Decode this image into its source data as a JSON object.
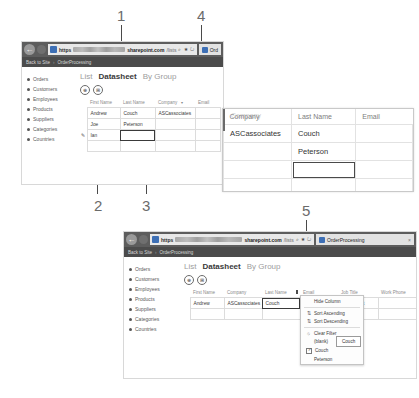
{
  "figure": {
    "callouts": [
      {
        "id": "1",
        "x": 117,
        "y": 8
      },
      {
        "id": "4",
        "x": 197,
        "y": 8
      },
      {
        "id": "2",
        "x": 94,
        "y": 198
      },
      {
        "id": "3",
        "x": 142,
        "y": 198
      },
      {
        "id": "5",
        "x": 302,
        "y": 203
      }
    ]
  },
  "top_window": {
    "browser": {
      "back_icon": "back-arrow-icon",
      "forward_icon": "forward-arrow-icon",
      "protocol_label": "https",
      "url_domain": "sharepoint.com",
      "url_tail": "/lists",
      "url_icons": "⌕ ★ ↻",
      "tab_label": "Ord"
    },
    "breadcrumb": {
      "back_link": "Back to Site",
      "separator": "›",
      "current": "OrderProcessing"
    },
    "sidebar": {
      "items": [
        {
          "label": "Orders"
        },
        {
          "label": "Customers"
        },
        {
          "label": "Employees"
        },
        {
          "label": "Products"
        },
        {
          "label": "Suppliers"
        },
        {
          "label": "Categories"
        },
        {
          "label": "Countries"
        }
      ]
    },
    "view_tabs": [
      {
        "label": "List",
        "active": false
      },
      {
        "label": "Datasheet",
        "active": true
      },
      {
        "label": "By Group",
        "active": false
      }
    ],
    "toolbar": {
      "new_item_icon": "⊕",
      "edit_grid_icon": "⊞"
    },
    "datasheet": {
      "columns": [
        "First Name",
        "Last Name",
        "Company",
        "Email"
      ],
      "sort_arrow": "▾",
      "rows": [
        {
          "edit_icon": "",
          "cells": [
            "Andrew",
            "Couch",
            "ASCassociates",
            ""
          ]
        },
        {
          "edit_icon": "",
          "cells": [
            "Joe",
            "Peterson",
            "",
            ""
          ]
        },
        {
          "edit_icon": "✎",
          "cells": [
            "Ian",
            "",
            "",
            ""
          ]
        }
      ],
      "selected_cell": {
        "row": 2,
        "col": 1
      }
    }
  },
  "magnifier": {
    "ghost_header": "Company",
    "columns": [
      "Company",
      "Last Name",
      "Email"
    ],
    "rows": [
      {
        "cells": [
          "ASCassociates",
          "Couch",
          ""
        ]
      },
      {
        "cells": [
          "",
          "Peterson",
          ""
        ]
      },
      {
        "cells": [
          "",
          "",
          ""
        ]
      },
      {
        "cells": [
          "",
          "",
          ""
        ]
      }
    ],
    "selected_cell": {
      "row": 2,
      "col": 1
    }
  },
  "bottom_window": {
    "browser": {
      "back_icon": "back-arrow-icon",
      "forward_icon": "forward-arrow-icon",
      "protocol_label": "https",
      "url_domain": "sharepoint.com",
      "url_tail": "/lists",
      "url_icons": "⌕ ★ ↻",
      "tab_label": "OrderProcessing",
      "tab_close": "×"
    },
    "breadcrumb": {
      "back_link": "Back to Site",
      "separator": "›",
      "current": "OrderProcessing"
    },
    "sidebar": {
      "items": [
        {
          "label": "Orders"
        },
        {
          "label": "Customers"
        },
        {
          "label": "Employees"
        },
        {
          "label": "Products"
        },
        {
          "label": "Suppliers"
        },
        {
          "label": "Categories"
        },
        {
          "label": "Countries"
        }
      ]
    },
    "view_tabs": [
      {
        "label": "List",
        "active": false
      },
      {
        "label": "Datasheet",
        "active": true
      },
      {
        "label": "By Group",
        "active": false
      }
    ],
    "toolbar": {
      "new_item_icon": "⊕",
      "edit_grid_icon": "⊞"
    },
    "datasheet": {
      "columns": [
        "First Name",
        "Company",
        "Last Name",
        "Email",
        "Job Title",
        "Work Phone"
      ],
      "rows": [
        {
          "cells": [
            "Andrew",
            "ASCassociates",
            "Couch",
            "",
            "Consultant",
            ""
          ]
        },
        {
          "cells": [
            "",
            "",
            "",
            "",
            "",
            ""
          ]
        }
      ],
      "active_cell_value": "Couch",
      "active_cell_col": 2
    },
    "context_menu": {
      "items": [
        {
          "label": "Hide Column",
          "icon": "",
          "type": "command"
        },
        {
          "label": "Sort Ascending",
          "icon": "⇅",
          "type": "command"
        },
        {
          "label": "Sort Descending",
          "icon": "⇅",
          "type": "command"
        },
        {
          "label": "Clear Filter",
          "icon": "⦸",
          "type": "command"
        },
        {
          "label": "(blank)",
          "icon": "",
          "type": "filter",
          "checked": false
        },
        {
          "label": "Couch",
          "icon": "",
          "type": "filter",
          "checked": true
        },
        {
          "label": "Peterson",
          "icon": "",
          "type": "filter",
          "checked": false
        }
      ]
    },
    "tooltip": {
      "text": "Couch"
    }
  }
}
